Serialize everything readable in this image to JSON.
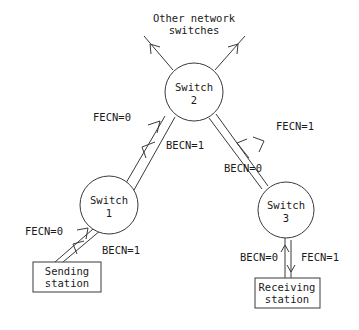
{
  "diagram": {
    "colors": {
      "stroke": "#3a3a3a",
      "text": "#1a1a1a",
      "background": "#ffffff"
    },
    "external_label": {
      "line1": "Other network",
      "line2": "switches"
    },
    "nodes": [
      {
        "id": "switch2",
        "type": "circle",
        "line1": "Switch",
        "line2": "2",
        "cx": 194,
        "cy": 92,
        "r": 29
      },
      {
        "id": "switch1",
        "type": "circle",
        "line1": "Switch",
        "line2": "1",
        "cx": 109,
        "cy": 205,
        "r": 29
      },
      {
        "id": "switch3",
        "type": "circle",
        "line1": "Switch",
        "line2": "3",
        "cx": 286,
        "cy": 210,
        "r": 28
      },
      {
        "id": "sending_station",
        "type": "box",
        "line1": "Sending",
        "line2": "station",
        "x": 33,
        "y": 262,
        "w": 68,
        "h": 30
      },
      {
        "id": "receiving_station",
        "type": "box",
        "line1": "Receiving",
        "line2": "station",
        "x": 255,
        "y": 278,
        "w": 65,
        "h": 30
      }
    ],
    "edge_labels": [
      {
        "id": "s1_s2_fecn",
        "text": "FECN=0",
        "x": 112,
        "y": 121
      },
      {
        "id": "s2_s1_becn",
        "text": "BECN=1",
        "x": 185,
        "y": 149
      },
      {
        "id": "s2_s3_fecn",
        "text": "FECN=1",
        "x": 295,
        "y": 130
      },
      {
        "id": "s3_s2_becn",
        "text": "BECN=0",
        "x": 243,
        "y": 172
      },
      {
        "id": "send_s1_fecn",
        "text": "FECN=0",
        "x": 44,
        "y": 235
      },
      {
        "id": "s1_send_becn",
        "text": "BECN=1",
        "x": 121,
        "y": 254
      },
      {
        "id": "s3_recv_becn",
        "text": "BECN=0",
        "x": 259,
        "y": 261
      },
      {
        "id": "recv_s3_fecn",
        "text": "FECN=1",
        "x": 320,
        "y": 261
      }
    ]
  }
}
